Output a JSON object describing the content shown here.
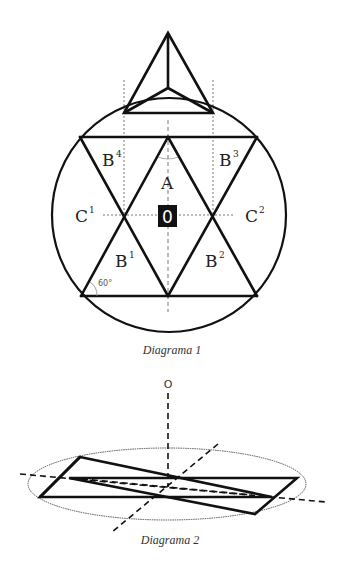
{
  "diagram1": {
    "caption": "Diagrama 1",
    "labels": {
      "A": "A",
      "B1": "B",
      "B1_sup": "1",
      "B2": "B",
      "B2_sup": "2",
      "B3": "B",
      "B3_sup": "3",
      "B4": "B",
      "B4_sup": "4",
      "C1": "C",
      "C1_sup": "1",
      "C2": "C",
      "C2_sup": "2",
      "center": "0",
      "angle": "60°"
    }
  },
  "diagram2": {
    "caption": "Diagrama 2",
    "labels": {
      "apex": "O"
    }
  },
  "colors": {
    "stroke": "#111111",
    "guide": "#555555",
    "center_box": "#111111",
    "center_text": "#ffffff"
  }
}
